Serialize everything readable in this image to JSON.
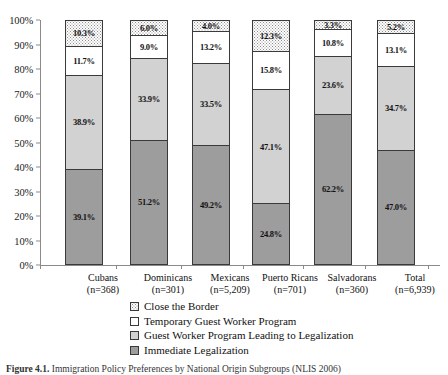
{
  "chart_data": {
    "type": "bar",
    "subtype": "100% stacked bar",
    "title": "",
    "xlabel": "",
    "ylabel": "",
    "ylim": [
      0,
      100
    ],
    "grid": false,
    "legend_position": "bottom",
    "y_ticks": [
      "0%",
      "10%",
      "20%",
      "30%",
      "40%",
      "50%",
      "60%",
      "70%",
      "80%",
      "90%",
      "100%"
    ],
    "y_tick_values": [
      0,
      10,
      20,
      30,
      40,
      50,
      60,
      70,
      80,
      90,
      100
    ],
    "categories": [
      {
        "label": "Cubans",
        "n_label": "(n=368)",
        "n": 368
      },
      {
        "label": "Dominicans",
        "n_label": "(n=301)",
        "n": 301
      },
      {
        "label": "Mexicans",
        "n_label": "(n=5,209)",
        "n": 5209
      },
      {
        "label": "Puerto Ricans",
        "n_label": "(n=701)",
        "n": 701
      },
      {
        "label": "Salvadorans",
        "n_label": "(n=360)",
        "n": 360
      },
      {
        "label": "Total",
        "n_label": "(n=6,939)",
        "n": 6939
      }
    ],
    "series": [
      {
        "name": "Close the Border",
        "fill": "dotted",
        "values": [
          10.3,
          6.0,
          4.0,
          12.3,
          3.3,
          5.2
        ],
        "labels": [
          "10.3%",
          "6.0%",
          "4.0%",
          "12.3%",
          "3.3%",
          "5.2%"
        ]
      },
      {
        "name": "Temporary Guest Worker Program",
        "fill": "white",
        "values": [
          11.7,
          9.0,
          13.2,
          15.8,
          10.8,
          13.1
        ],
        "labels": [
          "11.7%",
          "9.0%",
          "13.2%",
          "15.8%",
          "10.8%",
          "13.1%"
        ]
      },
      {
        "name": "Guest Worker Program Leading to Legalization",
        "fill": "lightgray",
        "values": [
          38.9,
          33.9,
          33.5,
          47.1,
          23.6,
          34.7
        ],
        "labels": [
          "38.9%",
          "33.9%",
          "33.5%",
          "47.1%",
          "23.6%",
          "34.7%"
        ]
      },
      {
        "name": "Immediate Legalization",
        "fill": "darkgray",
        "values": [
          39.1,
          51.2,
          49.2,
          24.8,
          62.2,
          47.0
        ],
        "labels": [
          "39.1%",
          "51.2%",
          "49.2%",
          "24.8%",
          "62.2%",
          "47.0%"
        ]
      }
    ],
    "stack_order_top_to_bottom": [
      "Close the Border",
      "Temporary Guest Worker Program",
      "Guest Worker Program Leading to Legalization",
      "Immediate Legalization"
    ],
    "colors": {
      "dotted": "#fdfdfd",
      "white": "#ffffff",
      "lightgray": "#d2d2d2",
      "darkgray": "#9d9d9d",
      "outline": "#3a3a3a",
      "axis": "#8a8a8a"
    }
  },
  "legend": {
    "items": [
      {
        "label": "Close the Border",
        "fill": "dotted"
      },
      {
        "label": "Temporary Guest Worker Program",
        "fill": "white"
      },
      {
        "label": "Guest Worker Program Leading to Legalization",
        "fill": "lightgray"
      },
      {
        "label": "Immediate Legalization",
        "fill": "darkgray"
      }
    ]
  },
  "caption": {
    "figure_number": "Figure 4.1.",
    "text": "Immigration Policy Preferences by National Origin Subgroups (NLIS 2006)"
  }
}
